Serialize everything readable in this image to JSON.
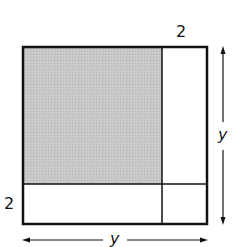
{
  "diagram": {
    "labels": {
      "top_strip_width": "2",
      "left_strip_height": "2",
      "right_side": "y",
      "bottom_side": "y"
    },
    "colors": {
      "shaded": "#c4c4c4",
      "stroke": "#111111",
      "background": "#ffffff"
    }
  }
}
